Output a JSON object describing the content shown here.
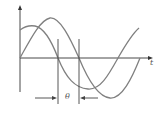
{
  "diagram": {
    "title": "",
    "axis_label_x": "t",
    "phase_label": "θ",
    "colors": {
      "stroke": "#7a7a7a",
      "axis": "#333333",
      "background": "#ffffff"
    },
    "waves": [
      {
        "name": "leading-wave",
        "description": "cosine-like curve starting above axis"
      },
      {
        "name": "lagging-wave",
        "description": "sine curve starting at origin"
      }
    ],
    "markers": [
      {
        "name": "zero-crossing-leading",
        "x": 58
      },
      {
        "name": "zero-crossing-lagging",
        "x": 79
      }
    ]
  }
}
